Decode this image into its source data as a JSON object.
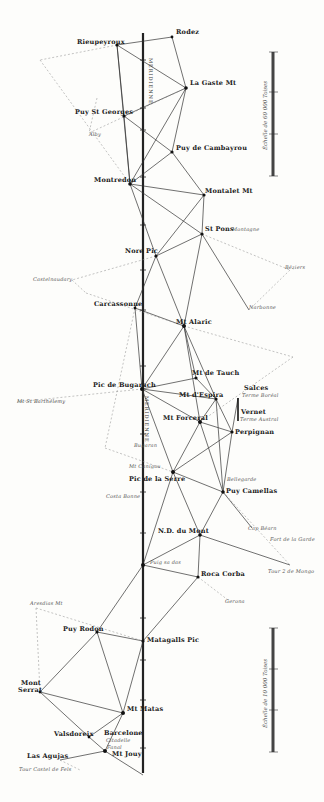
{
  "map": {
    "meridian_label_top": "MERIDIENNE",
    "meridian_label_mid": "MERIDIENNE",
    "stations": [
      {
        "id": "rodez",
        "name": "Rodez",
        "x": 172,
        "y": 37
      },
      {
        "id": "rieupeyroux",
        "name": "Rieupeyroux",
        "x": 117,
        "y": 45
      },
      {
        "id": "la_gaste",
        "name": "La Gaste Mt",
        "x": 186,
        "y": 88
      },
      {
        "id": "puy_st_georges",
        "name": "Puy St Georges",
        "x": 124,
        "y": 116
      },
      {
        "id": "puy_de_cambayrou",
        "name": "Puy de Cambayrou",
        "x": 172,
        "y": 152
      },
      {
        "id": "montredon",
        "name": "Montredon",
        "x": 130,
        "y": 184
      },
      {
        "id": "montalet",
        "name": "Montalet Mt",
        "x": 204,
        "y": 195
      },
      {
        "id": "st_pons",
        "name": "St Pons Montagne",
        "x": 202,
        "y": 234
      },
      {
        "id": "nore",
        "name": "Nore Pic",
        "x": 156,
        "y": 256
      },
      {
        "id": "carcassonne",
        "name": "Carcassonne",
        "x": 135,
        "y": 308
      },
      {
        "id": "alaric",
        "name": "Mt Alaric",
        "x": 184,
        "y": 326
      },
      {
        "id": "tauch",
        "name": "Mt de Tauch",
        "x": 196,
        "y": 378
      },
      {
        "id": "bugarach",
        "name": "Pic de Bugarach",
        "x": 142,
        "y": 389
      },
      {
        "id": "espira",
        "name": "Mt d'Espira",
        "x": 216,
        "y": 399
      },
      {
        "id": "forceral",
        "name": "Mt Forceral",
        "x": 200,
        "y": 422
      },
      {
        "id": "salces",
        "name": "Salces",
        "x": 238,
        "y": 398
      },
      {
        "id": "vernet",
        "name": "Vernet",
        "x": 238,
        "y": 421
      },
      {
        "id": "perpignan",
        "name": "Perpignan",
        "x": 232,
        "y": 432
      },
      {
        "id": "pic_de_la_serre",
        "name": "Pic de la Serre",
        "x": 173,
        "y": 472
      },
      {
        "id": "puy_camellas",
        "name": "Puy Camellas",
        "x": 223,
        "y": 492
      },
      {
        "id": "nd_du_mont",
        "name": "N.D. du Mont",
        "x": 200,
        "y": 535
      },
      {
        "id": "puig_sa_das",
        "name": "Puig sa das",
        "x": 143,
        "y": 565
      },
      {
        "id": "rocacorba",
        "name": "Roca Corba",
        "x": 198,
        "y": 577
      },
      {
        "id": "matagalls",
        "name": "Matagalls Pic",
        "x": 143,
        "y": 641
      },
      {
        "id": "puy_rodon",
        "name": "Puy Rodon",
        "x": 97,
        "y": 632
      },
      {
        "id": "montserrat",
        "name": "Mont Serrat",
        "x": 40,
        "y": 692
      },
      {
        "id": "mt_matas",
        "name": "Mt Matas",
        "x": 123,
        "y": 713
      },
      {
        "id": "valsdoreix",
        "name": "Valsdoreix",
        "x": 89,
        "y": 737
      },
      {
        "id": "barcelone",
        "name": "Barcelone",
        "x": 106,
        "y": 750
      },
      {
        "id": "mt_jouy",
        "name": "Mt Jouy",
        "x": 105,
        "y": 751
      },
      {
        "id": "las_agujas",
        "name": "Las Agujas",
        "x": 60,
        "y": 755
      }
    ],
    "labels": [
      {
        "text": "Rodez",
        "x": 176,
        "y": 32,
        "cls": ""
      },
      {
        "text": "Rieupeyroux",
        "x": 77,
        "y": 42,
        "cls": ""
      },
      {
        "text": "La Gaste Mt",
        "x": 190,
        "y": 83,
        "cls": ""
      },
      {
        "text": "Puy St Georges",
        "x": 75,
        "y": 112,
        "cls": ""
      },
      {
        "text": "Alby",
        "x": 89,
        "y": 135,
        "cls": "it"
      },
      {
        "text": "Puy de Cambayrou",
        "x": 176,
        "y": 148,
        "cls": ""
      },
      {
        "text": "Montredon",
        "x": 94,
        "y": 180,
        "cls": ""
      },
      {
        "text": "Montalet Mt",
        "x": 205,
        "y": 191,
        "cls": ""
      },
      {
        "text": "St Pons",
        "x": 205,
        "y": 229,
        "cls": ""
      },
      {
        "text": "Montagne",
        "x": 232,
        "y": 230,
        "cls": "it"
      },
      {
        "text": "Nore Pic",
        "x": 125,
        "y": 251,
        "cls": ""
      },
      {
        "text": "Castelnaudary",
        "x": 33,
        "y": 280,
        "cls": "it"
      },
      {
        "text": "Béziers",
        "x": 285,
        "y": 268,
        "cls": "it"
      },
      {
        "text": "Carcassonne",
        "x": 94,
        "y": 304,
        "cls": ""
      },
      {
        "text": "Narbonne",
        "x": 249,
        "y": 308,
        "cls": "it"
      },
      {
        "text": "Mt Alaric",
        "x": 176,
        "y": 322,
        "cls": ""
      },
      {
        "text": "Mt de Tauch",
        "x": 192,
        "y": 373,
        "cls": ""
      },
      {
        "text": "Pic de Bugarach",
        "x": 93,
        "y": 385,
        "cls": ""
      },
      {
        "text": "Mt St Barthélemy",
        "x": 17,
        "y": 402,
        "cls": "sm"
      },
      {
        "text": "Salces",
        "x": 244,
        "y": 388,
        "cls": ""
      },
      {
        "text": "Terme Boréal",
        "x": 242,
        "y": 396,
        "cls": "it"
      },
      {
        "text": "Mt d'Espira",
        "x": 179,
        "y": 395,
        "cls": ""
      },
      {
        "text": "Vernet",
        "x": 241,
        "y": 412,
        "cls": ""
      },
      {
        "text": "Terme Austral",
        "x": 240,
        "y": 420,
        "cls": "it"
      },
      {
        "text": "Mt Forceral",
        "x": 163,
        "y": 418,
        "cls": ""
      },
      {
        "text": "Perpignan",
        "x": 235,
        "y": 432,
        "cls": ""
      },
      {
        "text": "Bugaran",
        "x": 134,
        "y": 446,
        "cls": "it"
      },
      {
        "text": "Mt Canigou",
        "x": 129,
        "y": 467,
        "cls": "it"
      },
      {
        "text": "Pic de la Serre",
        "x": 129,
        "y": 479,
        "cls": ""
      },
      {
        "text": "Bellegarde",
        "x": 227,
        "y": 480,
        "cls": "it"
      },
      {
        "text": "Puy Camellas",
        "x": 226,
        "y": 491,
        "cls": ""
      },
      {
        "text": "Costa Bonne",
        "x": 106,
        "y": 497,
        "cls": "it"
      },
      {
        "text": "Cap Béarn",
        "x": 248,
        "y": 529,
        "cls": "it"
      },
      {
        "text": "Fort de la Garde",
        "x": 270,
        "y": 540,
        "cls": "it"
      },
      {
        "text": "N.D. du Mont",
        "x": 158,
        "y": 531,
        "cls": ""
      },
      {
        "text": "Puig sa das",
        "x": 150,
        "y": 563,
        "cls": "it"
      },
      {
        "text": "Roca Corba",
        "x": 201,
        "y": 574,
        "cls": ""
      },
      {
        "text": "Tour 2 de Mongo",
        "x": 268,
        "y": 572,
        "cls": "it"
      },
      {
        "text": "Gerona",
        "x": 225,
        "y": 602,
        "cls": "it"
      },
      {
        "text": "Aresdias Mt",
        "x": 30,
        "y": 604,
        "cls": "it"
      },
      {
        "text": "Puy Rodon",
        "x": 63,
        "y": 629,
        "cls": ""
      },
      {
        "text": "Matagalls Pic",
        "x": 147,
        "y": 640,
        "cls": ""
      },
      {
        "text": "Mont",
        "x": 21,
        "y": 683,
        "cls": ""
      },
      {
        "text": "Serrat",
        "x": 18,
        "y": 690,
        "cls": ""
      },
      {
        "text": "Mt Matas",
        "x": 127,
        "y": 709,
        "cls": ""
      },
      {
        "text": "Valsdoreix",
        "x": 54,
        "y": 734,
        "cls": ""
      },
      {
        "text": "Barcelone",
        "x": 104,
        "y": 733,
        "cls": ""
      },
      {
        "text": "Citadelle",
        "x": 106,
        "y": 741,
        "cls": "it"
      },
      {
        "text": "Fanal",
        "x": 107,
        "y": 748,
        "cls": "it"
      },
      {
        "text": "Mt Jouy",
        "x": 112,
        "y": 754,
        "cls": ""
      },
      {
        "text": "Las Agujas",
        "x": 27,
        "y": 756,
        "cls": ""
      },
      {
        "text": "Tour Castel de Fels",
        "x": 19,
        "y": 770,
        "cls": "it"
      }
    ],
    "scales": [
      {
        "id": "scale-top",
        "x": 273,
        "y1": 52,
        "y2": 176,
        "label": "Échelle de 60 000 Toises",
        "tick_top": "60 000",
        "tick_mid": "30 000"
      },
      {
        "id": "scale-bottom",
        "x": 273,
        "y1": 628,
        "y2": 752,
        "label": "Échelle de 10 000 Toises",
        "tick_top": "10 000",
        "tick_mid": "5 000"
      }
    ]
  }
}
